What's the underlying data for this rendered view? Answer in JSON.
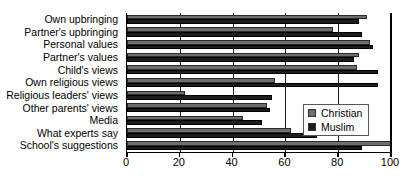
{
  "chart_data": {
    "type": "bar",
    "orientation": "horizontal",
    "title": "",
    "xlabel": "",
    "ylabel": "",
    "xlim": [
      0,
      100
    ],
    "xticks": [
      0,
      20,
      40,
      60,
      80,
      100
    ],
    "grid": true,
    "legend_position": "inside-right",
    "categories": [
      "Own upbringing",
      "Partner's upbringing",
      "Personal values",
      "Partner's values",
      "Child's views",
      "Own religious views",
      "Religious leaders' views",
      "Other parents' views",
      "Media",
      "What experts say",
      "School's suggestions"
    ],
    "series": [
      {
        "name": "Christian",
        "color": "#6e6e6e",
        "values": [
          91,
          78,
          92,
          88,
          87,
          56,
          22,
          53,
          44,
          62,
          100
        ]
      },
      {
        "name": "Muslim",
        "color": "#1c1c1c",
        "values": [
          88,
          89,
          93,
          86,
          95,
          95,
          55,
          54,
          51,
          72,
          89
        ]
      }
    ]
  },
  "legend": {
    "items": [
      {
        "label": "Christian",
        "swatch": "christian"
      },
      {
        "label": "Muslim",
        "swatch": "muslim"
      }
    ]
  }
}
